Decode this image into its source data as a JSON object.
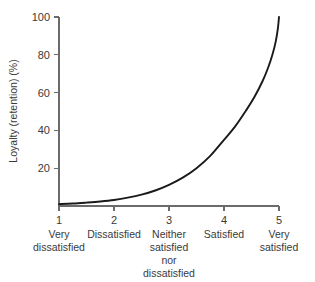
{
  "chart_data": {
    "type": "line",
    "title": "",
    "xlabel": "",
    "ylabel": "Loyalty (retention) (%)",
    "xlim": [
      1,
      5
    ],
    "ylim": [
      0,
      100
    ],
    "grid": false,
    "legend": "none",
    "x_tick_numbers": [
      "1",
      "2",
      "3",
      "4",
      "5"
    ],
    "y_tick_labels": [
      "20",
      "40",
      "60",
      "80",
      "100"
    ],
    "y_tick_values": [
      20,
      40,
      60,
      80,
      100
    ],
    "categories": [
      {
        "value": 1,
        "number": "1",
        "lines": [
          "Very",
          "dissatisfied"
        ]
      },
      {
        "value": 2,
        "number": "2",
        "lines": [
          "Dissatisfied"
        ]
      },
      {
        "value": 3,
        "number": "3",
        "lines": [
          "Neither",
          "satisfied",
          "nor",
          "dissatisfied"
        ]
      },
      {
        "value": 4,
        "number": "4",
        "lines": [
          "Satisfied"
        ]
      },
      {
        "value": 5,
        "number": "5",
        "lines": [
          "Very",
          "satisfied"
        ]
      }
    ],
    "series": [
      {
        "name": "Loyalty (retention)",
        "color": "#1a1a1a",
        "x": [
          1.0,
          1.25,
          1.5,
          1.75,
          2.0,
          2.25,
          2.5,
          2.75,
          3.0,
          3.25,
          3.5,
          3.75,
          4.0,
          4.2,
          4.4,
          4.55,
          4.7,
          4.8,
          4.88,
          4.94,
          4.98,
          5.0
        ],
        "values": [
          1.0,
          1.3,
          1.8,
          2.4,
          3.2,
          4.4,
          6.0,
          8.2,
          11.2,
          15.0,
          20.0,
          26.5,
          35.0,
          42.0,
          50.5,
          57.5,
          66.0,
          73.0,
          80.0,
          87.0,
          94.0,
          100.0
        ]
      }
    ]
  },
  "axis_colors": {
    "axis": "#6b6b6b",
    "curve": "#1a1a1a",
    "text": "#3a3a3a",
    "background": "#ffffff"
  }
}
